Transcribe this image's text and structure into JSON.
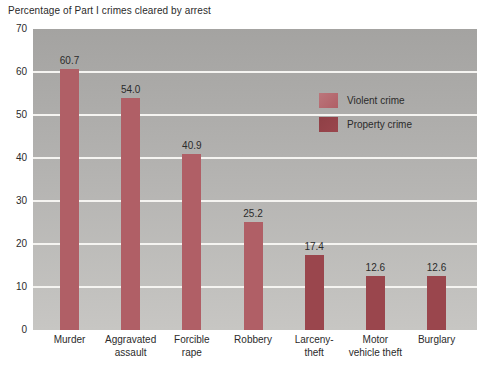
{
  "chart_data": {
    "type": "bar",
    "title": "Percentage of Part I crimes cleared by arrest",
    "categories": [
      "Murder",
      "Aggravated\nassault",
      "Forcible\nrape",
      "Robbery",
      "Larceny-\ntheft",
      "Motor\nvehicle theft",
      "Burglary"
    ],
    "values": [
      60.7,
      54.0,
      40.9,
      25.2,
      17.4,
      12.6,
      12.6
    ],
    "value_labels": [
      "60.7",
      "54.0",
      "40.9",
      "25.2",
      "17.4",
      "12.6",
      "12.6"
    ],
    "bar_series": [
      "violent",
      "violent",
      "violent",
      "violent",
      "property",
      "property",
      "property"
    ],
    "ylim": [
      0,
      70
    ],
    "yticks": [
      0,
      10,
      20,
      30,
      40,
      50,
      60,
      70
    ],
    "grid": true,
    "legend": {
      "position": "inside-upper-right",
      "items": [
        {
          "id": "violent",
          "label": "Violent crime",
          "swatch_color": "#bb767b"
        },
        {
          "id": "property",
          "label": "Property crime",
          "swatch_color": "#8f4046"
        }
      ]
    },
    "colors": {
      "violent_bar": "#b05f66",
      "property_bar": "#9a464d",
      "plot_bg_top": "#a4a3a1",
      "plot_bg_bottom": "#c7c6c3",
      "gridline": "#f5f4f1",
      "text": "#2b2b2b",
      "page_bg": "#ffffff"
    }
  }
}
